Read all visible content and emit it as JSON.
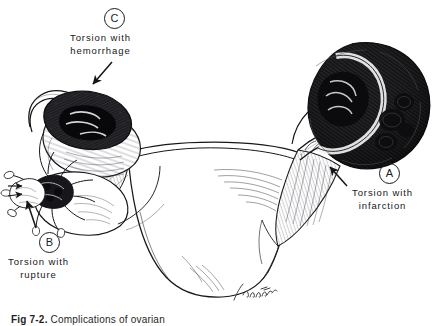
{
  "figure": {
    "caption_number": "Fig 7-2.",
    "caption_text": "Complications of ovarian",
    "signature": "E. Padgitt",
    "background_color": "#ffffff",
    "ink_color": "#1b1b1e"
  },
  "labels": [
    {
      "marker": "A",
      "line1": "Torsion with",
      "line2": "infarction",
      "marker_x": 379,
      "marker_y": 163,
      "text_x": 352,
      "text_y": 187,
      "arrow": {
        "x1": 347,
        "y1": 186,
        "x2": 329,
        "y2": 166
      }
    },
    {
      "marker": "B",
      "line1": "Torsion with",
      "line2": "rupture",
      "marker_x": 39,
      "marker_y": 232,
      "text_x": 12,
      "text_y": 256,
      "arrow": {
        "x1": 35,
        "y1": 228,
        "x2": 26,
        "y2": 200
      }
    },
    {
      "marker": "C",
      "line1": "Torsion with",
      "line2": "hemorrhage",
      "marker_x": 104,
      "marker_y": 8,
      "text_x": 74,
      "text_y": 32,
      "arrow": {
        "x1": 112,
        "y1": 62,
        "x2": 92,
        "y2": 83
      }
    }
  ],
  "anatomy": {
    "parts": [
      "uterus",
      "fallopian-tube-left",
      "fallopian-tube-right",
      "broad-ligament",
      "ovary-infarcted-right",
      "ovary-hemorrhagic-left",
      "ovary-ruptured-left",
      "fimbriae"
    ]
  }
}
